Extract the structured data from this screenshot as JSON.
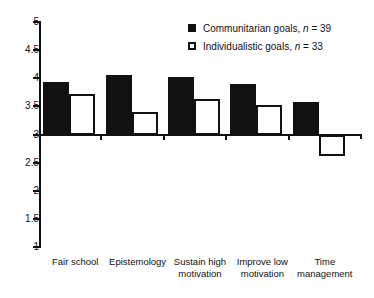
{
  "chart_data": {
    "type": "bar",
    "title": "",
    "subtitle": "",
    "xlabel": "",
    "ylabel": "",
    "ylim": [
      1,
      5
    ],
    "ytick_labels": [
      "5",
      "4.5",
      "4",
      "3.5",
      "3",
      "2.5",
      "2",
      "1.5",
      "1"
    ],
    "ytick_values": [
      5,
      4.5,
      4,
      3.5,
      3,
      2.5,
      2,
      1.5,
      1
    ],
    "baseline_value": 3,
    "grid": false,
    "legend_position": "top-right",
    "categories": [
      "Fair school",
      "Epistemology",
      "Sustain high motivation",
      "Improve low motivation",
      "Time management"
    ],
    "series": [
      {
        "name": "Communitarian goals",
        "n": 39,
        "legend_label": "Communitarian goals, n = 39",
        "marker": "filled-square",
        "color": "#111111",
        "values": [
          3.93,
          4.05,
          4.03,
          3.9,
          3.57
        ]
      },
      {
        "name": "Individualistic goals",
        "n": 33,
        "legend_label": "Individualistic goals, n = 33",
        "marker": "open-square",
        "color": "#ffffff",
        "values": [
          3.72,
          3.4,
          3.63,
          3.53,
          2.62
        ]
      }
    ]
  },
  "legend": {
    "items": [
      {
        "label_main": "Communitarian goals, ",
        "label_italic": "n",
        "label_tail": " = 39"
      },
      {
        "label_main": "Individualistic goals, ",
        "label_italic": "n",
        "label_tail": " = 33"
      }
    ]
  },
  "axis": {
    "ticks": [
      {
        "label": "5"
      },
      {
        "label": "4.5"
      },
      {
        "label": "4"
      },
      {
        "label": "3.5"
      },
      {
        "label": "3"
      },
      {
        "label": "2.5"
      },
      {
        "label": "2"
      },
      {
        "label": "1.5"
      },
      {
        "label": "1"
      }
    ]
  },
  "categories": [
    {
      "line1": "Fair school",
      "line2": ""
    },
    {
      "line1": "Epistemology",
      "line2": ""
    },
    {
      "line1": "Sustain high",
      "line2": "motivation"
    },
    {
      "line1": "Improve low",
      "line2": "motivation"
    },
    {
      "line1": "Time",
      "line2": "management"
    }
  ]
}
